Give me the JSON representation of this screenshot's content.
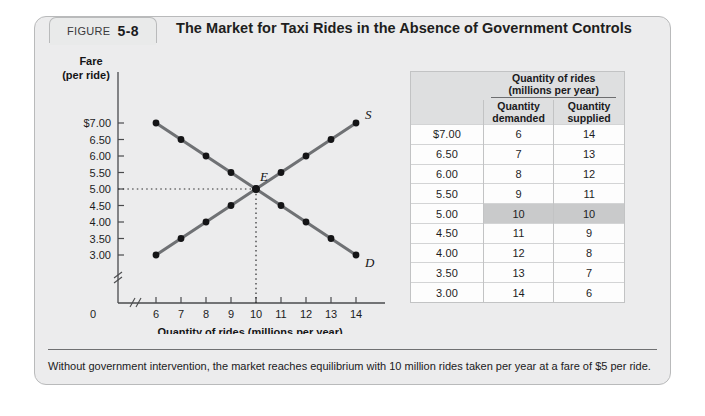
{
  "figure": {
    "tab_word": "FIGURE",
    "tab_number": "5-8",
    "title": "The Market for Taxi Rides in the Absence of Government Controls",
    "caption": "Without government intervention, the market reaches equilibrium with 10 million rides taken per year at a fare of $5 per ride."
  },
  "table": {
    "group_header_line1": "Quantity of rides",
    "group_header_line2": "(millions per year)",
    "fare_header_line1": "Fare",
    "fare_header_line2": "(per ride)",
    "demanded_header_line1": "Quantity",
    "demanded_header_line2": "demanded",
    "supplied_header_line1": "Quantity",
    "supplied_header_line2": "supplied",
    "rows": [
      {
        "fare": "$7.00",
        "demanded": "6",
        "supplied": "14",
        "highlight": false
      },
      {
        "fare": "6.50",
        "demanded": "7",
        "supplied": "13",
        "highlight": false
      },
      {
        "fare": "6.00",
        "demanded": "8",
        "supplied": "12",
        "highlight": false
      },
      {
        "fare": "5.50",
        "demanded": "9",
        "supplied": "11",
        "highlight": false
      },
      {
        "fare": "5.00",
        "demanded": "10",
        "supplied": "10",
        "highlight": true
      },
      {
        "fare": "4.50",
        "demanded": "11",
        "supplied": "9",
        "highlight": false
      },
      {
        "fare": "4.00",
        "demanded": "12",
        "supplied": "8",
        "highlight": false
      },
      {
        "fare": "3.50",
        "demanded": "13",
        "supplied": "7",
        "highlight": false
      },
      {
        "fare": "3.00",
        "demanded": "14",
        "supplied": "6",
        "highlight": false
      }
    ]
  },
  "chart_data": {
    "type": "line",
    "title": "The Market for Taxi Rides in the Absence of Government Controls",
    "xlabel": "Quantity of rides (millions per year)",
    "ylabel_line1": "Fare",
    "ylabel_line2": "(per ride)",
    "origin_label": "0",
    "x_ticks": [
      6,
      7,
      8,
      9,
      10,
      11,
      12,
      13,
      14
    ],
    "x_tick_labels": [
      "6",
      "7",
      "8",
      "9",
      "10",
      "11",
      "12",
      "13",
      "14"
    ],
    "y_ticks": [
      7.0,
      6.5,
      6.0,
      5.5,
      5.0,
      4.5,
      4.0,
      3.5,
      3.0
    ],
    "y_tick_labels": [
      "$7.00",
      "6.50",
      "6.00",
      "5.50",
      "5.00",
      "4.50",
      "4.00",
      "3.50",
      "3.00"
    ],
    "xlim": [
      6,
      14
    ],
    "ylim": [
      3.0,
      7.0
    ],
    "axis_break_x": true,
    "axis_break_y": true,
    "grid": false,
    "legend": "none",
    "series": [
      {
        "name": "Demand",
        "label": "D",
        "color": "#6f7174",
        "points": [
          {
            "x": 6,
            "y": 7.0
          },
          {
            "x": 7,
            "y": 6.5
          },
          {
            "x": 8,
            "y": 6.0
          },
          {
            "x": 9,
            "y": 5.5
          },
          {
            "x": 10,
            "y": 5.0
          },
          {
            "x": 11,
            "y": 4.5
          },
          {
            "x": 12,
            "y": 4.0
          },
          {
            "x": 13,
            "y": 3.5
          },
          {
            "x": 14,
            "y": 3.0
          }
        ]
      },
      {
        "name": "Supply",
        "label": "S",
        "color": "#6f7174",
        "points": [
          {
            "x": 6,
            "y": 3.0
          },
          {
            "x": 7,
            "y": 3.5
          },
          {
            "x": 8,
            "y": 4.0
          },
          {
            "x": 9,
            "y": 4.5
          },
          {
            "x": 10,
            "y": 5.0
          },
          {
            "x": 11,
            "y": 5.5
          },
          {
            "x": 12,
            "y": 6.0
          },
          {
            "x": 13,
            "y": 6.5
          },
          {
            "x": 14,
            "y": 7.0
          }
        ]
      }
    ],
    "equilibrium": {
      "label": "E",
      "x": 10,
      "y": 5.0,
      "guide_lines": "dotted"
    },
    "marker_color": "#141416"
  }
}
